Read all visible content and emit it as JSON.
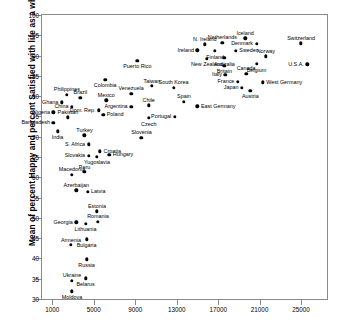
{
  "chart_data": {
    "type": "scatter",
    "title": "",
    "ylabel": "Mean of percent Happy and percent Satisfied with life as a whole",
    "xlabel": "",
    "xlim": [
      0,
      27500
    ],
    "ylim": [
      30,
      100
    ],
    "xticks": [
      1000,
      5000,
      9000,
      13000,
      17000,
      21000,
      25000
    ],
    "yticks": [
      30,
      35,
      40,
      45,
      50,
      55,
      60,
      65,
      70,
      75,
      80,
      85,
      90,
      95,
      100
    ],
    "grid": false,
    "legend": "none",
    "point_color": "#000000",
    "axis_color": "#8a8a8a",
    "points": [
      {
        "label": "Nigeria",
        "x": 1100,
        "y": 76.0,
        "lp": "left"
      },
      {
        "label": "Bangladesh",
        "x": 1100,
        "y": 73.4,
        "lp": "left"
      },
      {
        "label": "India",
        "x": 1500,
        "y": 71.3,
        "lp": "below"
      },
      {
        "label": "Ghana",
        "x": 1900,
        "y": 78.5,
        "lp": "left"
      },
      {
        "label": "Philippines",
        "x": 2400,
        "y": 80.3,
        "lp": "above"
      },
      {
        "label": "Pakistan",
        "x": 2500,
        "y": 74.8,
        "lp": "above"
      },
      {
        "label": "China",
        "x": 2900,
        "y": 77.3,
        "lp": "left"
      },
      {
        "label": "Brazil",
        "x": 3700,
        "y": 79.6,
        "lp": "above"
      },
      {
        "label": "Turkey",
        "x": 4100,
        "y": 70.3,
        "lp": "above"
      },
      {
        "label": "S. Africa",
        "x": 4500,
        "y": 68.1,
        "lp": "left"
      },
      {
        "label": "Slovakia",
        "x": 4500,
        "y": 65.3,
        "lp": "left"
      },
      {
        "label": "Yugoslavia",
        "x": 5300,
        "y": 65.1,
        "lp": "below"
      },
      {
        "label": "Croatia",
        "x": 5600,
        "y": 66.4,
        "lp": "right"
      },
      {
        "label": "Hungary",
        "x": 6500,
        "y": 65.6,
        "lp": "right"
      },
      {
        "label": "Macedonia",
        "x": 2900,
        "y": 60.6,
        "lp": "above"
      },
      {
        "label": "Peru",
        "x": 4100,
        "y": 61.3,
        "lp": "above"
      },
      {
        "label": "Azerbaijan",
        "x": 3300,
        "y": 56.8,
        "lp": "above"
      },
      {
        "label": "Latvia",
        "x": 4400,
        "y": 56.4,
        "lp": "right"
      },
      {
        "label": "Estonia",
        "x": 5300,
        "y": 51.6,
        "lp": "above"
      },
      {
        "label": "Georgia",
        "x": 3300,
        "y": 48.9,
        "lp": "left"
      },
      {
        "label": "Lithuania",
        "x": 4200,
        "y": 48.5,
        "lp": "below"
      },
      {
        "label": "Romania",
        "x": 5400,
        "y": 49.1,
        "lp": "above"
      },
      {
        "label": "Armenia",
        "x": 2800,
        "y": 43.3,
        "lp": "above"
      },
      {
        "label": "Bulgaria",
        "x": 4300,
        "y": 44.7,
        "lp": "below"
      },
      {
        "label": "Russia",
        "x": 4300,
        "y": 39.8,
        "lp": "below"
      },
      {
        "label": "Ukraine",
        "x": 2900,
        "y": 34.5,
        "lp": "above"
      },
      {
        "label": "Belarus",
        "x": 4200,
        "y": 35.1,
        "lp": "below"
      },
      {
        "label": "Moldova",
        "x": 2900,
        "y": 31.9,
        "lp": "below"
      },
      {
        "label": "Slovenia",
        "x": 9600,
        "y": 69.7,
        "lp": "above"
      },
      {
        "label": "Czech",
        "x": 10300,
        "y": 74.6,
        "lp": "below"
      },
      {
        "label": "Poland",
        "x": 5900,
        "y": 75.4,
        "lp": "right"
      },
      {
        "label": "Dom. Rep.",
        "x": 5500,
        "y": 76.5,
        "lp": "left"
      },
      {
        "label": "Mexico",
        "x": 6200,
        "y": 79.0,
        "lp": "above"
      },
      {
        "label": "Argentina",
        "x": 8600,
        "y": 77.3,
        "lp": "left"
      },
      {
        "label": "Venezuela",
        "x": 8600,
        "y": 80.6,
        "lp": "above"
      },
      {
        "label": "Colombia",
        "x": 6100,
        "y": 84.0,
        "lp": "below"
      },
      {
        "label": "Chile",
        "x": 10300,
        "y": 77.7,
        "lp": "above"
      },
      {
        "label": "Taiwan",
        "x": 10600,
        "y": 82.5,
        "lp": "above"
      },
      {
        "label": "South Korea",
        "x": 12700,
        "y": 82.1,
        "lp": "above"
      },
      {
        "label": "Puerto Rico",
        "x": 9200,
        "y": 88.7,
        "lp": "below"
      },
      {
        "label": "Portugal",
        "x": 12800,
        "y": 74.9,
        "lp": "left"
      },
      {
        "label": "Spain",
        "x": 13700,
        "y": 78.6,
        "lp": "above"
      },
      {
        "label": "East Germany",
        "x": 15000,
        "y": 77.5,
        "lp": "right"
      },
      {
        "label": "Ireland",
        "x": 15000,
        "y": 91.3,
        "lp": "left"
      },
      {
        "label": "N. Ireland",
        "x": 15700,
        "y": 92.8,
        "lp": "above"
      },
      {
        "label": "New Zealand",
        "x": 15900,
        "y": 89.2,
        "lp": "below"
      },
      {
        "label": "Finland",
        "x": 16700,
        "y": 91.1,
        "lp": "below"
      },
      {
        "label": "Netherlands",
        "x": 17400,
        "y": 93.1,
        "lp": "above"
      },
      {
        "label": "Australia",
        "x": 17600,
        "y": 89.4,
        "lp": "below"
      },
      {
        "label": "Britain",
        "x": 17600,
        "y": 87.5,
        "lp": "below"
      },
      {
        "label": "Italy",
        "x": 17700,
        "y": 85.3,
        "lp": "left"
      },
      {
        "label": "Sweden",
        "x": 18700,
        "y": 91.1,
        "lp": "right"
      },
      {
        "label": "France",
        "x": 18900,
        "y": 83.5,
        "lp": "left"
      },
      {
        "label": "Japan",
        "x": 19300,
        "y": 82.0,
        "lp": "left"
      },
      {
        "label": "Iceland",
        "x": 19600,
        "y": 94.3,
        "lp": "above"
      },
      {
        "label": "Canada",
        "x": 19700,
        "y": 85.5,
        "lp": "above"
      },
      {
        "label": "Austria",
        "x": 20100,
        "y": 81.3,
        "lp": "below"
      },
      {
        "label": "Denmark",
        "x": 20700,
        "y": 92.9,
        "lp": "left"
      },
      {
        "label": "Belgium",
        "x": 20700,
        "y": 87.9,
        "lp": "below"
      },
      {
        "label": "West Germany",
        "x": 21300,
        "y": 83.4,
        "lp": "right"
      },
      {
        "label": "Norway",
        "x": 21600,
        "y": 89.8,
        "lp": "above"
      },
      {
        "label": "Switzerland",
        "x": 25000,
        "y": 93.0,
        "lp": "above"
      },
      {
        "label": "U.S.A.",
        "x": 25600,
        "y": 87.8,
        "lp": "left"
      }
    ]
  }
}
